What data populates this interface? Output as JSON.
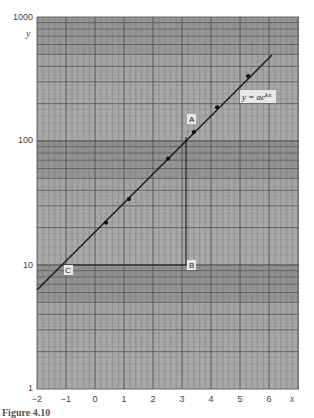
{
  "chart_data": {
    "type": "scatter",
    "title": "",
    "xlabel": "x",
    "ylabel": "y",
    "xscale": "linear",
    "yscale": "log",
    "xlim": [
      -2,
      7
    ],
    "ylim": [
      1,
      1000
    ],
    "x_ticks": [
      "-2",
      "-1",
      "0",
      "1",
      "2",
      "3",
      "4",
      "5",
      "6"
    ],
    "y_ticks": [
      "1",
      "10",
      "100",
      "1000"
    ],
    "grid": true,
    "series": [
      {
        "name": "data points",
        "x": [
          -0.86,
          0.38,
          1.17,
          2.52,
          3.41,
          4.21,
          5.28
        ],
        "y": [
          8.9,
          22,
          34,
          72,
          118,
          187,
          334
        ]
      },
      {
        "name": "fit line y = ae^kx",
        "type": "line",
        "x": [
          -2,
          6.07
        ],
        "y": [
          6.3,
          490
        ]
      }
    ],
    "annotations": [
      {
        "label": "A",
        "x": 3.1,
        "y": 105
      },
      {
        "label": "B",
        "x": 3.1,
        "y": 10
      },
      {
        "label": "C",
        "x": -1.05,
        "y": 10
      },
      {
        "label": "y = ae^kx",
        "x": 5.3,
        "y": 190
      }
    ],
    "triangle": {
      "vertices": [
        "A",
        "B",
        "C"
      ],
      "right_angle_at": "B"
    }
  },
  "labels": {
    "equation_base": "y = ae",
    "equation_exp": "kx",
    "x_axis": "x",
    "y_axis": "y",
    "point_a": "A",
    "point_b": "B",
    "point_c": "C",
    "caption": "Figure 4.10"
  }
}
